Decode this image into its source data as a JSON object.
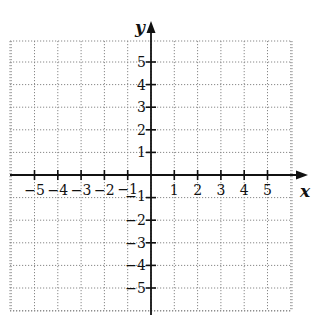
{
  "graph": {
    "x_axis_label": "x",
    "y_axis_label": "y",
    "x_range": [
      -6,
      6
    ],
    "y_range": [
      -6,
      6
    ],
    "x_tick_labels": [
      "−5",
      "−4",
      "−3",
      "−2",
      "−1",
      "1",
      "2",
      "3",
      "4",
      "5"
    ],
    "x_tick_values": [
      -5,
      -4,
      -3,
      -2,
      -1,
      1,
      2,
      3,
      4,
      5
    ],
    "y_tick_labels": [
      "5",
      "4",
      "3",
      "2",
      "1",
      "−1",
      "−2",
      "−3",
      "−4",
      "−5"
    ],
    "y_tick_values": [
      5,
      4,
      3,
      2,
      1,
      -1,
      -2,
      -3,
      -4,
      -5
    ],
    "grid": "dotted",
    "colors": {
      "axis": "#111111",
      "grid": "#888888",
      "background": "#ffffff"
    }
  }
}
